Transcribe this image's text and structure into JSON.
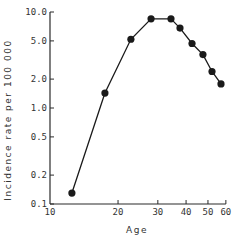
{
  "chart_data": {
    "type": "line",
    "title": "",
    "xlabel": "Age",
    "ylabel": "Incidence rate per 100 000",
    "xscale": "log",
    "yscale": "log",
    "xlim": [
      10,
      60
    ],
    "ylim": [
      0.1,
      10.0
    ],
    "grid": false,
    "legend": null,
    "x_ticks": [
      10,
      20,
      30,
      40,
      50,
      60
    ],
    "x_tick_labels": [
      "10",
      "20",
      "30",
      "40",
      "50",
      "60"
    ],
    "y_ticks": [
      0.1,
      0.2,
      0.5,
      1.0,
      2.0,
      5.0,
      10.0
    ],
    "y_tick_labels": [
      "0.1",
      "0.2",
      "0.5",
      "1.0",
      "2.0",
      "5.0",
      "10.0"
    ],
    "series": [
      {
        "name": "Incidence rate",
        "marker": "filled-circle",
        "color": "#1a1a1a",
        "x": [
          12.5,
          17.5,
          22.8,
          28.0,
          34.3,
          37.6,
          42.5,
          47.5,
          52.1,
          57.1
        ],
        "values": [
          0.13,
          1.43,
          5.2,
          8.5,
          8.5,
          6.8,
          4.7,
          3.6,
          2.4,
          1.78
        ]
      }
    ]
  },
  "axes": {
    "x_title": "Age",
    "y_title": "Incidence rate per 100 000"
  }
}
